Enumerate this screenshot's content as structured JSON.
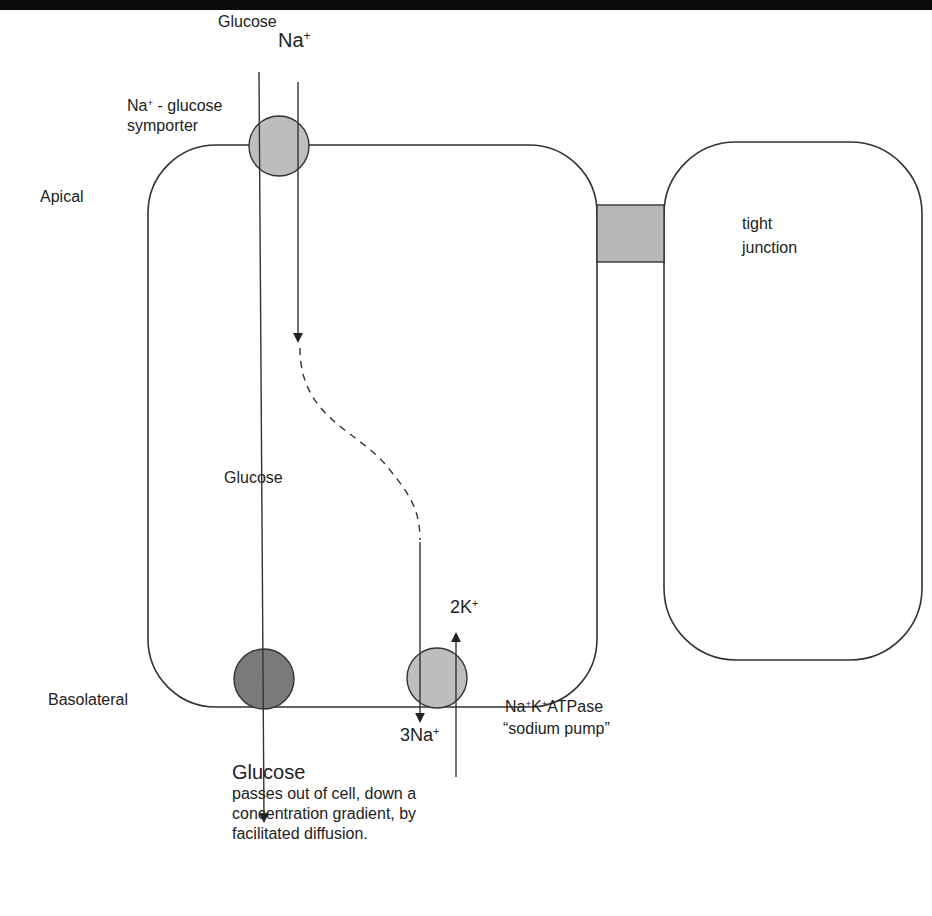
{
  "diagram": {
    "colors": {
      "top_bar": "#0a0a0a",
      "line": "#333333",
      "symporter_fill": "#bdbdbd",
      "glut_fill": "#7a7a7a",
      "pump_fill": "#bdbdbd",
      "junction_fill": "#b8b8b8"
    },
    "labels": {
      "glucose_top": "Glucose",
      "na_top": "Na",
      "na_top_sup": "+",
      "symporter_line1_na": "Na",
      "symporter_line1_sup": "+",
      "symporter_line1_rest": " - glucose",
      "symporter_line2": "symporter",
      "apical": "Apical",
      "basolateral": "Basolateral",
      "tight_junction_line1": "tight",
      "tight_junction_line2": "junction",
      "glucose_mid": "Glucose",
      "k_ion": "2K",
      "k_ion_sup": "+",
      "na_ion": "3Na",
      "na_ion_sup": "+",
      "pump_na": "Na",
      "pump_sup1": "+",
      "pump_k": "K",
      "pump_sup2": "+",
      "pump_rest": "ATPase",
      "pump_line2": "“sodium pump”",
      "glucose_bottom": "Glucose",
      "glucose_bottom_desc": "passes out of cell, down a concentration gradient, by facilitated diffusion."
    }
  }
}
